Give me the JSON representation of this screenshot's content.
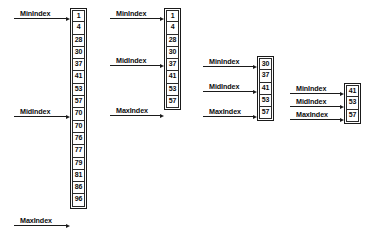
{
  "diagram": {
    "pointer_labels": {
      "min": "MinIndex",
      "mid": "MidIndex",
      "max": "MaxIndex"
    },
    "colors": {
      "stroke": "#1a1a1a",
      "text": "#0d0d0d",
      "background": "#ffffff"
    },
    "stages": [
      {
        "name": "stage-1",
        "values": [
          "1",
          "4",
          "28",
          "30",
          "37",
          "41",
          "53",
          "57",
          "70",
          "70",
          "76",
          "77",
          "79",
          "81",
          "86",
          "96"
        ],
        "pointers": [
          {
            "label": "MinIndex",
            "target_value": "1",
            "target_index": 0
          },
          {
            "label": "MidIndex",
            "target_value": "57",
            "target_index": 7
          },
          {
            "label": "MaxIndex",
            "target_value": "96",
            "target_index": 15
          }
        ]
      },
      {
        "name": "stage-2",
        "values": [
          "1",
          "4",
          "28",
          "30",
          "37",
          "41",
          "53",
          "57"
        ],
        "pointers": [
          {
            "label": "MinIndex",
            "target_value": "1",
            "target_index": 0
          },
          {
            "label": "MidIndex",
            "target_value": "30",
            "target_index": 3
          },
          {
            "label": "MaxIndex",
            "target_value": "57",
            "target_index": 7
          }
        ]
      },
      {
        "name": "stage-3",
        "values": [
          "30",
          "37",
          "41",
          "53",
          "57"
        ],
        "pointers": [
          {
            "label": "MinIndex",
            "target_value": "30",
            "target_index": 0
          },
          {
            "label": "MidIndex",
            "target_value": "41",
            "target_index": 2
          },
          {
            "label": "MaxIndex",
            "target_value": "57",
            "target_index": 4
          }
        ]
      },
      {
        "name": "stage-4",
        "values": [
          "41",
          "53",
          "57"
        ],
        "pointers": [
          {
            "label": "MinIndex",
            "target_value": "41",
            "target_index": 0
          },
          {
            "label": "MidIndex",
            "target_value": "53",
            "target_index": 1
          },
          {
            "label": "MaxIndex",
            "target_value": "57",
            "target_index": 2
          }
        ]
      }
    ]
  }
}
